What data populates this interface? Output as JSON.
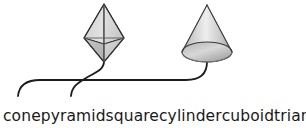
{
  "canvas": {
    "width": 306,
    "height": 128,
    "background_color": "#ffffff"
  },
  "diagram": {
    "type": "shape-matching-worksheet",
    "shapes": [
      {
        "name": "octahedron-solid",
        "semantic": "double pyramid (square bipyramid)",
        "apex_top": [
          104,
          4
        ],
        "apex_bottom": [
          104,
          62
        ],
        "left_vertex": [
          84,
          38
        ],
        "right_vertex": [
          124,
          38
        ],
        "front_vertex": [
          104,
          44
        ],
        "fill_light": "#dcdcdc",
        "fill_mid": "#c8c8c8",
        "fill_dark": "#b0b0b0",
        "stroke_color": "#3a3a3a"
      },
      {
        "name": "cone-solid",
        "semantic": "cone",
        "apex": [
          207,
          5
        ],
        "base_center": [
          207,
          52
        ],
        "base_radius_x": 25,
        "base_radius_y": 10,
        "fill_light": "#e3e3e3",
        "fill_mid": "#c4c4c4",
        "fill_dark": "#9e9e9e",
        "stroke_color": "#3a3a3a"
      }
    ],
    "connector_lines": [
      {
        "name": "connector-cone",
        "from_shape": "cone-solid",
        "to_word": "cone",
        "stroke_color": "#1c1c1c",
        "stroke_width": 1.8
      },
      {
        "name": "connector-pyramid",
        "from_shape": "octahedron-solid",
        "to_word": "pyramid",
        "stroke_color": "#1c1c1c",
        "stroke_width": 1.8
      }
    ]
  },
  "labels": {
    "text_color": "#1a1a1a",
    "words": [
      {
        "text": "cone"
      },
      {
        "text": "pyramid"
      },
      {
        "text": "square"
      },
      {
        "text": "cylinder"
      },
      {
        "text": "cuboid"
      },
      {
        "text": "triangle"
      }
    ]
  }
}
